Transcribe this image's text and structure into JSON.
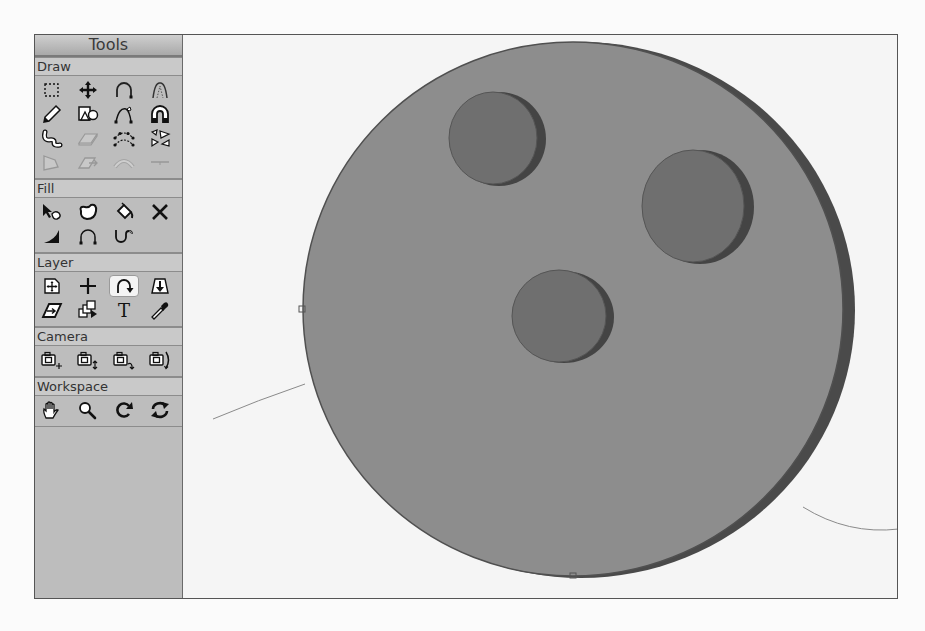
{
  "tools_panel": {
    "title": "Tools",
    "sections": [
      {
        "label": "Draw",
        "tools": [
          {
            "name": "rectangle-select",
            "icon": "dashed-rect-icon"
          },
          {
            "name": "move",
            "icon": "move-arrows-icon"
          },
          {
            "name": "arc",
            "icon": "arc-icon"
          },
          {
            "name": "bezier-arch",
            "icon": "dotted-arch-icon"
          },
          {
            "name": "pencil",
            "icon": "pencil-icon"
          },
          {
            "name": "shapes",
            "icon": "shapes-icon"
          },
          {
            "name": "curve-edit",
            "icon": "curve-edit-icon"
          },
          {
            "name": "magnet",
            "icon": "magnet-icon"
          },
          {
            "name": "freeform",
            "icon": "squiggle-icon"
          },
          {
            "name": "extrude-plane",
            "icon": "plane-icon",
            "disabled": true
          },
          {
            "name": "multi-point-curve",
            "icon": "multi-curve-icon"
          },
          {
            "name": "triangles",
            "icon": "triangles-icon"
          },
          {
            "name": "polygon",
            "icon": "polygon-icon",
            "disabled": true
          },
          {
            "name": "plane-arrow",
            "icon": "plane-arrow-icon",
            "disabled": true
          },
          {
            "name": "tube",
            "icon": "tube-icon",
            "disabled": true
          },
          {
            "name": "line",
            "icon": "line-icon",
            "disabled": true
          }
        ]
      },
      {
        "label": "Fill",
        "tools": [
          {
            "name": "select-fill",
            "icon": "arrow-blob-icon"
          },
          {
            "name": "blob",
            "icon": "blob-icon"
          },
          {
            "name": "paint-bucket",
            "icon": "bucket-icon"
          },
          {
            "name": "delete",
            "icon": "x-icon"
          },
          {
            "name": "ramp",
            "icon": "ramp-icon"
          },
          {
            "name": "arch-fill",
            "icon": "arch-points-icon"
          },
          {
            "name": "u-curve",
            "icon": "u-curve-icon"
          },
          {
            "name": "empty",
            "icon": "blank-icon",
            "disabled": true
          }
        ]
      },
      {
        "label": "Layer",
        "tools": [
          {
            "name": "layer-move",
            "icon": "layer-move-icon"
          },
          {
            "name": "crosshair",
            "icon": "plus-icon"
          },
          {
            "name": "layer-arc",
            "icon": "arc-arrow-icon",
            "active": true
          },
          {
            "name": "layer-drop",
            "icon": "layer-drop-icon"
          },
          {
            "name": "plane-move",
            "icon": "plane-move-icon"
          },
          {
            "name": "stack",
            "icon": "stack-icon"
          },
          {
            "name": "text",
            "icon": "text-icon"
          },
          {
            "name": "eyedropper",
            "icon": "eyedropper-icon"
          }
        ]
      },
      {
        "label": "Camera",
        "tools": [
          {
            "name": "camera-pan",
            "icon": "camera-plus-icon"
          },
          {
            "name": "camera-vertical",
            "icon": "camera-vertical-icon"
          },
          {
            "name": "camera-turn",
            "icon": "camera-turn-icon"
          },
          {
            "name": "camera-orbit",
            "icon": "camera-orbit-icon"
          }
        ]
      },
      {
        "label": "Workspace",
        "tools": [
          {
            "name": "hand",
            "icon": "hand-icon"
          },
          {
            "name": "zoom",
            "icon": "magnifier-icon"
          },
          {
            "name": "rotate",
            "icon": "rotate-icon"
          },
          {
            "name": "refresh",
            "icon": "refresh-icon"
          }
        ]
      }
    ]
  },
  "viewport": {
    "object": "disk-with-three-holes",
    "colors": {
      "background": "#f5f5f5",
      "disk_face": "#8d8d8d",
      "disk_rim": "#4a4a4a",
      "hole_face": "#6f6f6f",
      "hole_rim": "#444444",
      "guide_curve": "#8a8a8a"
    }
  }
}
